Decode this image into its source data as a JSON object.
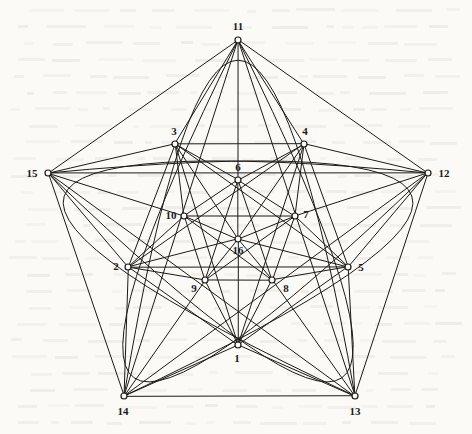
{
  "figure": {
    "ink_color": "#1a1a18",
    "paper_color": "#fbfaf7",
    "stroke_width": 1.0,
    "node_radius": 3.0,
    "vertices": [
      {
        "id": 1,
        "label": "1",
        "x": 238,
        "y": 345,
        "label_x": 237,
        "label_y": 358,
        "ring": "middle"
      },
      {
        "id": 2,
        "label": "2",
        "x": 128,
        "y": 267,
        "label_x": 116,
        "label_y": 266,
        "ring": "middle"
      },
      {
        "id": 3,
        "label": "3",
        "x": 175,
        "y": 144,
        "label_x": 174,
        "label_y": 131,
        "ring": "middle"
      },
      {
        "id": 4,
        "label": "4",
        "x": 304,
        "y": 144,
        "label_x": 305,
        "label_y": 131,
        "ring": "middle"
      },
      {
        "id": 5,
        "label": "5",
        "x": 348,
        "y": 267,
        "label_x": 361,
        "label_y": 267,
        "ring": "middle"
      },
      {
        "id": 6,
        "label": "6",
        "x": 238,
        "y": 180,
        "label_x": 238,
        "label_y": 167,
        "ring": "inner"
      },
      {
        "id": 7,
        "label": "7",
        "x": 295,
        "y": 216,
        "label_x": 306,
        "label_y": 214,
        "ring": "inner"
      },
      {
        "id": 8,
        "label": "8",
        "x": 272,
        "y": 280,
        "label_x": 286,
        "label_y": 288,
        "ring": "inner"
      },
      {
        "id": 9,
        "label": "9",
        "x": 205,
        "y": 280,
        "label_x": 194,
        "label_y": 288,
        "ring": "inner"
      },
      {
        "id": 10,
        "label": "10",
        "x": 184,
        "y": 216,
        "label_x": 171,
        "label_y": 215,
        "ring": "inner"
      },
      {
        "id": 11,
        "label": "11",
        "x": 238,
        "y": 40,
        "label_x": 238,
        "label_y": 26,
        "ring": "outer"
      },
      {
        "id": 12,
        "label": "12",
        "x": 428,
        "y": 173,
        "label_x": 444,
        "label_y": 173,
        "ring": "outer"
      },
      {
        "id": 13,
        "label": "13",
        "x": 355,
        "y": 396,
        "label_x": 355,
        "label_y": 411,
        "ring": "outer"
      },
      {
        "id": 14,
        "label": "14",
        "x": 124,
        "y": 396,
        "label_x": 123,
        "label_y": 411,
        "ring": "outer"
      },
      {
        "id": 15,
        "label": "15",
        "x": 48,
        "y": 173,
        "label_x": 32,
        "label_y": 173,
        "ring": "outer"
      },
      {
        "id": 16,
        "label": "16",
        "x": 238,
        "y": 239,
        "label_x": 238,
        "label_y": 250,
        "ring": "center"
      }
    ],
    "edges": [
      [
        11,
        12
      ],
      [
        12,
        13
      ],
      [
        13,
        14
      ],
      [
        14,
        15
      ],
      [
        15,
        11
      ],
      [
        11,
        13
      ],
      [
        13,
        15
      ],
      [
        15,
        12
      ],
      [
        12,
        14
      ],
      [
        14,
        11
      ],
      [
        1,
        2
      ],
      [
        2,
        3
      ],
      [
        3,
        4
      ],
      [
        4,
        5
      ],
      [
        5,
        1
      ],
      [
        1,
        3
      ],
      [
        3,
        5
      ],
      [
        5,
        2
      ],
      [
        2,
        4
      ],
      [
        4,
        1
      ],
      [
        6,
        7
      ],
      [
        7,
        8
      ],
      [
        8,
        9
      ],
      [
        9,
        10
      ],
      [
        10,
        6
      ],
      [
        6,
        8
      ],
      [
        8,
        10
      ],
      [
        10,
        7
      ],
      [
        7,
        9
      ],
      [
        9,
        6
      ],
      [
        1,
        14
      ],
      [
        1,
        13
      ],
      [
        2,
        15
      ],
      [
        2,
        14
      ],
      [
        3,
        11
      ],
      [
        3,
        15
      ],
      [
        4,
        11
      ],
      [
        4,
        12
      ],
      [
        5,
        12
      ],
      [
        5,
        13
      ],
      [
        1,
        8
      ],
      [
        1,
        9
      ],
      [
        2,
        9
      ],
      [
        2,
        10
      ],
      [
        3,
        10
      ],
      [
        3,
        6
      ],
      [
        4,
        6
      ],
      [
        4,
        7
      ],
      [
        5,
        7
      ],
      [
        5,
        8
      ],
      [
        16,
        6
      ],
      [
        16,
        7
      ],
      [
        16,
        8
      ],
      [
        16,
        9
      ],
      [
        16,
        10
      ],
      [
        16,
        1
      ],
      [
        16,
        2
      ],
      [
        16,
        3
      ],
      [
        16,
        4
      ],
      [
        16,
        5
      ],
      [
        11,
        6
      ],
      [
        12,
        7
      ],
      [
        13,
        8
      ],
      [
        14,
        9
      ],
      [
        15,
        10
      ]
    ],
    "arcs": [
      {
        "name": "arc-through-11",
        "from": 14,
        "to": 13,
        "via_x": 238,
        "via_y": 60
      },
      {
        "name": "arc-through-12",
        "from": 15,
        "to": 14,
        "via_x": 412,
        "via_y": 196
      },
      {
        "name": "arc-through-13",
        "from": 11,
        "to": 15,
        "via_x": 342,
        "via_y": 378
      },
      {
        "name": "arc-through-14",
        "from": 12,
        "to": 11,
        "via_x": 134,
        "via_y": 378
      },
      {
        "name": "arc-through-15",
        "from": 13,
        "to": 12,
        "via_x": 64,
        "via_y": 196
      }
    ]
  }
}
